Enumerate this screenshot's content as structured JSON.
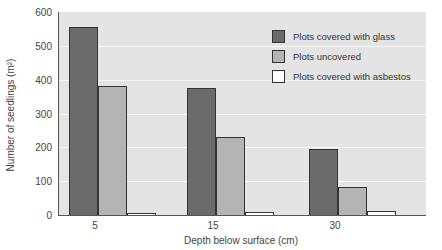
{
  "chart_data": {
    "type": "bar",
    "title": "",
    "xlabel": "Depth below surface (cm)",
    "ylabel": "Number of seedlings (m²)",
    "ylim": [
      0,
      600
    ],
    "yticks": [
      0,
      100,
      200,
      300,
      400,
      500,
      600
    ],
    "categories": [
      "5",
      "15",
      "30"
    ],
    "series": [
      {
        "name": "Plots covered with glass",
        "color": "#6b6b6b",
        "values": [
          555,
          375,
          195
        ]
      },
      {
        "name": "Plots uncovered",
        "color": "#b4b4b4",
        "values": [
          380,
          230,
          82
        ]
      },
      {
        "name": "Plots covered with asbestos",
        "color": "#ffffff",
        "values": [
          4,
          8,
          12
        ]
      }
    ],
    "grid": true,
    "legend_position": "upper right"
  }
}
